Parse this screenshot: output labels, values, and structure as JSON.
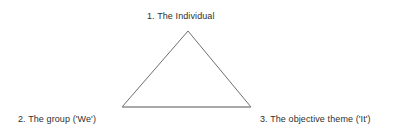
{
  "diagram": {
    "background_color": "#ffffff",
    "line_color": "#6e6e6e",
    "base_line_color": "#9a9a9a",
    "text_color": "#2f2f2f",
    "shape": {
      "name": "triangle",
      "vertices": {
        "apex": {
          "x": 188,
          "y": 31
        },
        "bottom_left": {
          "x": 122,
          "y": 107
        },
        "bottom_right": {
          "x": 251,
          "y": 107
        }
      },
      "points_path": "188,31 122,107 251,107",
      "stroke_width": 1
    },
    "labels": {
      "apex": "1. The Individual",
      "bottom_left": "2. The group ('We')",
      "bottom_right": "3. The objective theme ('It')"
    }
  }
}
